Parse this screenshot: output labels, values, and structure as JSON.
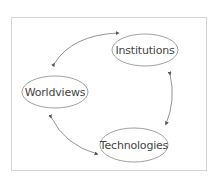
{
  "diagram": {
    "type": "cycle",
    "nodes": [
      {
        "id": "institutions",
        "label": "Institutions",
        "cx": 145,
        "cy": 50,
        "rx": 33,
        "ry": 16
      },
      {
        "id": "worldviews",
        "label": "Worldviews",
        "cx": 55,
        "cy": 92,
        "rx": 33,
        "ry": 16
      },
      {
        "id": "technologies",
        "label": "Technologies",
        "cx": 134,
        "cy": 145,
        "rx": 34,
        "ry": 17
      }
    ],
    "edges": [
      {
        "from": "worldviews",
        "to": "institutions",
        "bidirectional": true
      },
      {
        "from": "institutions",
        "to": "technologies",
        "bidirectional": true
      },
      {
        "from": "technologies",
        "to": "worldviews",
        "bidirectional": true
      }
    ],
    "colors": {
      "stroke": "#777777",
      "frame": "#d4d4d4",
      "text": "#444444"
    }
  }
}
